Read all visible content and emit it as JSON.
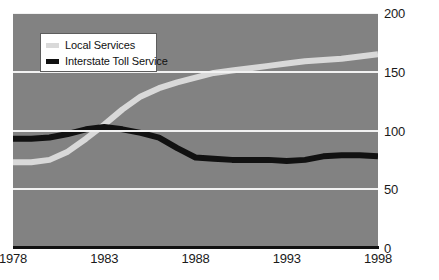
{
  "chart_data": {
    "type": "line",
    "title": "",
    "xlabel": "",
    "ylabel": "",
    "xlim": [
      1978,
      1998
    ],
    "ylim": [
      0,
      200
    ],
    "grid": true,
    "legend_position": "top-left",
    "y_ticks": [
      "0",
      "50",
      "100",
      "150",
      "200"
    ],
    "y_tick_values": [
      0,
      50,
      100,
      150,
      200
    ],
    "x_ticks": [
      "1978",
      "1983",
      "1988",
      "1993",
      "1998"
    ],
    "x_tick_values": [
      1978,
      1983,
      1988,
      1993,
      1998
    ],
    "colors": {
      "plot_background": "#828282",
      "gridline": "#f2f2f2",
      "local_services": "#d9d9d9",
      "interstate_toll_service": "#111111",
      "axis": "#111111",
      "page_background": "#ffffff",
      "text": "#1a1a1a"
    },
    "series": [
      {
        "name": "Local Services",
        "color": "#d9d9d9",
        "x": [
          1978,
          1979,
          1980,
          1981,
          1982,
          1983,
          1984,
          1985,
          1986,
          1987,
          1988,
          1989,
          1990,
          1991,
          1992,
          1993,
          1994,
          1995,
          1996,
          1997,
          1998
        ],
        "values": [
          73,
          73,
          75,
          82,
          93,
          105,
          118,
          129,
          136,
          141,
          145,
          149,
          151,
          153,
          155,
          157,
          159,
          160,
          161,
          163,
          165
        ]
      },
      {
        "name": "Interstate Toll Service",
        "color": "#111111",
        "x": [
          1978,
          1979,
          1980,
          1981,
          1982,
          1983,
          1984,
          1985,
          1986,
          1987,
          1988,
          1989,
          1990,
          1991,
          1992,
          1993,
          1994,
          1995,
          1996,
          1997,
          1998
        ],
        "values": [
          93,
          93,
          94,
          97,
          101,
          103,
          101,
          98,
          94,
          85,
          77,
          76,
          75,
          75,
          75,
          74,
          75,
          78,
          79,
          79,
          78
        ]
      }
    ]
  },
  "legend": {
    "items": [
      {
        "label": "Local Services"
      },
      {
        "label": "Interstate Toll Service"
      }
    ]
  },
  "y_axis": {
    "ticks": [
      {
        "label": "200"
      },
      {
        "label": "150"
      },
      {
        "label": "100"
      },
      {
        "label": "50"
      },
      {
        "label": "0"
      }
    ]
  },
  "x_axis": {
    "ticks": [
      {
        "label": "1978"
      },
      {
        "label": "1983"
      },
      {
        "label": "1988"
      },
      {
        "label": "1993"
      },
      {
        "label": "1998"
      }
    ]
  }
}
